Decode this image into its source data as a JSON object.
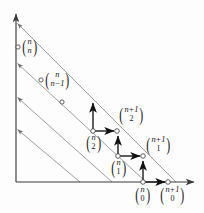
{
  "figure": {
    "type": "lattice-diagram",
    "width": 204,
    "height": 213,
    "colors": {
      "axis": "#3a3a3a",
      "diagonal": "#8c8c8c",
      "arrow": "#111111",
      "node_stroke": "#444444",
      "node_fill": "#ffffff",
      "text": "#1a1a1a",
      "background": "#fdfdfd"
    },
    "axes": {
      "origin": {
        "x": 16,
        "y": 182
      },
      "x_axis_end": {
        "x": 196,
        "y": 182
      },
      "y_axis_end": {
        "x": 16,
        "y": 12
      },
      "x_arrowhead": true,
      "y_arrowhead": true
    },
    "diagonals": [
      {
        "id": "diag-0",
        "y_intercept": {
          "x": 16,
          "y": 22
        },
        "x_intercept": {
          "x": 176,
          "y": 182
        },
        "arrowhead_at_axis": true
      },
      {
        "id": "diag-1",
        "y_intercept": {
          "x": 16,
          "y": 62
        },
        "x_intercept": {
          "x": 146,
          "y": 182
        },
        "arrowhead_at_axis": true
      },
      {
        "id": "diag-2",
        "y_intercept": {
          "x": 16,
          "y": 96
        },
        "x_intercept": {
          "x": 112,
          "y": 182
        },
        "arrowhead_at_axis": true
      },
      {
        "id": "diag-3",
        "y_intercept": {
          "x": 16,
          "y": 128
        },
        "x_intercept": {
          "x": 80,
          "y": 182
        },
        "arrowhead_at_axis": true
      }
    ],
    "nodes": [
      {
        "id": "node-n-n",
        "x": 18,
        "y": 47,
        "labelled": true
      },
      {
        "id": "node-n-nm1",
        "x": 41,
        "y": 80,
        "labelled": true
      },
      {
        "id": "node-extra",
        "x": 62,
        "y": 102,
        "labelled": false
      },
      {
        "id": "node-n-2",
        "x": 93,
        "y": 131,
        "labelled": true
      },
      {
        "id": "node-np1-2",
        "x": 117,
        "y": 131,
        "labelled": true
      },
      {
        "id": "node-n-1",
        "x": 118,
        "y": 156,
        "labelled": true
      },
      {
        "id": "node-np1-1",
        "x": 143,
        "y": 156,
        "labelled": true
      },
      {
        "id": "node-n-0",
        "x": 143,
        "y": 182,
        "labelled": true
      },
      {
        "id": "node-np1-0",
        "x": 168,
        "y": 182,
        "labelled": true
      }
    ],
    "arrows": [
      {
        "id": "arrow-up-from-n2",
        "from": {
          "x": 93,
          "y": 131
        },
        "to": {
          "x": 93,
          "y": 101
        },
        "direction": "up"
      },
      {
        "id": "arrow-right-from-n2",
        "from": {
          "x": 93,
          "y": 131
        },
        "to": {
          "x": 117,
          "y": 131
        },
        "direction": "right"
      },
      {
        "id": "arrow-up-from-n1",
        "from": {
          "x": 118,
          "y": 156
        },
        "to": {
          "x": 118,
          "y": 134
        },
        "direction": "up"
      },
      {
        "id": "arrow-right-from-n1",
        "from": {
          "x": 118,
          "y": 156
        },
        "to": {
          "x": 143,
          "y": 156
        },
        "direction": "right"
      },
      {
        "id": "arrow-up-from-n0",
        "from": {
          "x": 143,
          "y": 182
        },
        "to": {
          "x": 143,
          "y": 159
        },
        "direction": "up"
      },
      {
        "id": "arrow-right-from-n0",
        "from": {
          "x": 143,
          "y": 182
        },
        "to": {
          "x": 168,
          "y": 182
        },
        "direction": "right"
      }
    ],
    "labels": [
      {
        "id": "label-n-n",
        "top": "n",
        "bottom": "n",
        "x": 21,
        "y": 38,
        "bottom_style": "italic"
      },
      {
        "id": "label-n-nm1",
        "top": "n",
        "bottom": "n−1",
        "x": 44,
        "y": 71,
        "bottom_style": "italic"
      },
      {
        "id": "label-np1-2",
        "top": "n+1",
        "bottom": "2",
        "x": 118,
        "y": 107,
        "bottom_style": "upright"
      },
      {
        "id": "label-n-2",
        "top": "n",
        "bottom": "2",
        "x": 85,
        "y": 134,
        "bottom_style": "upright"
      },
      {
        "id": "label-np1-1",
        "top": "n+1",
        "bottom": "1",
        "x": 145,
        "y": 137,
        "bottom_style": "upright"
      },
      {
        "id": "label-n-1",
        "top": "n",
        "bottom": "1",
        "x": 110,
        "y": 159,
        "bottom_style": "upright"
      },
      {
        "id": "label-n-0",
        "top": "n",
        "bottom": "0",
        "x": 134,
        "y": 186,
        "bottom_style": "upright"
      },
      {
        "id": "label-np1-0",
        "top": "n+1",
        "bottom": "0",
        "x": 159,
        "y": 186,
        "bottom_style": "upright"
      }
    ]
  }
}
